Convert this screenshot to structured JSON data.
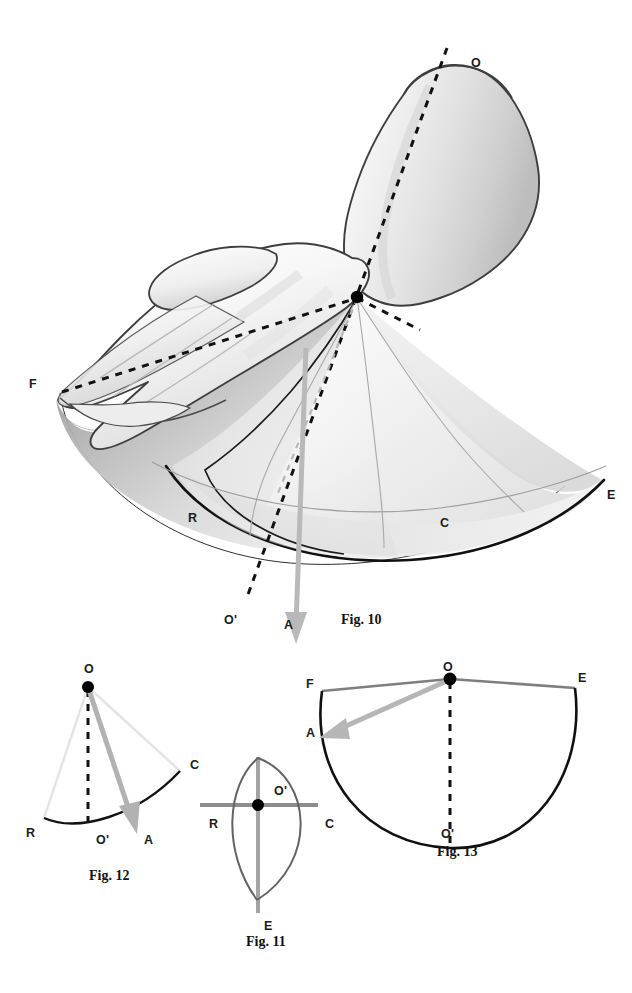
{
  "page": {
    "width": 632,
    "height": 993,
    "background": "#ffffff"
  },
  "colors": {
    "ink": "#1a1a1a",
    "outline": "#3c3c3c",
    "cone_edge_dark": "#111111",
    "cone_rule_gray": "#9a9a9a",
    "arrow_gray": "#b4b4b4",
    "radius_gray": "#8c8c8c",
    "lens_gray": "#6e6e6e",
    "axis_gray": "#9d9d9d",
    "faint_gray": "#e2e2e2",
    "skin_light": "#fbfbfb",
    "skin_mid": "#d8d8d8",
    "skin_shadow": "#9c9c9c"
  },
  "figures": [
    {
      "id": "fig10",
      "caption": "Fig. 10",
      "caption_pos": {
        "x": 341,
        "y": 613
      },
      "description": "Hand and forearm with cone of circumduction about the wrist",
      "labels": [
        {
          "text": "O",
          "name": "label-o",
          "x": 471,
          "y": 57,
          "meaning": "axis proximal point"
        },
        {
          "text": "F",
          "name": "label-f",
          "x": 29,
          "y": 378,
          "meaning": "flexion"
        },
        {
          "text": "E",
          "name": "label-e",
          "x": 607,
          "y": 489,
          "meaning": "extension"
        },
        {
          "text": "R",
          "name": "label-r",
          "x": 188,
          "y": 512,
          "meaning": "radial deviation"
        },
        {
          "text": "C",
          "name": "label-c",
          "x": 440,
          "y": 517,
          "meaning": "ulnar / cubital deviation"
        },
        {
          "text": "O'",
          "name": "label-o-prime",
          "x": 224,
          "y": 614,
          "meaning": "axis distal point"
        },
        {
          "text": "A",
          "name": "label-a",
          "x": 284,
          "y": 619,
          "meaning": "axis of the cone"
        }
      ]
    },
    {
      "id": "fig12",
      "caption": "Fig. 12",
      "caption_pos": {
        "x": 89,
        "y": 869
      },
      "description": "Lateral projection of the cone: sector O-R-C with axis OA",
      "labels": [
        {
          "text": "O",
          "name": "label-o",
          "x": 84,
          "y": 663,
          "meaning": "apex"
        },
        {
          "text": "C",
          "name": "label-c",
          "x": 190,
          "y": 759,
          "meaning": "ulnar / cubital deviation"
        },
        {
          "text": "R",
          "name": "label-r",
          "x": 26,
          "y": 827,
          "meaning": "radial deviation"
        },
        {
          "text": "O'",
          "name": "label-o-prime",
          "x": 96,
          "y": 834,
          "meaning": "axis foot"
        },
        {
          "text": "A",
          "name": "label-a",
          "x": 144,
          "y": 834,
          "meaning": "cone axis arrow"
        }
      ]
    },
    {
      "id": "fig11",
      "caption": "Fig. 11",
      "caption_pos": {
        "x": 246,
        "y": 935
      },
      "description": "Base of the cone seen end-on: an ellipse-like lens with axes R-C and O'-E",
      "labels": [
        {
          "text": "O'",
          "name": "label-o-prime",
          "x": 274,
          "y": 785,
          "meaning": "centre of base"
        },
        {
          "text": "R",
          "name": "label-r",
          "x": 209,
          "y": 818,
          "meaning": "radial deviation"
        },
        {
          "text": "C",
          "name": "label-c",
          "x": 325,
          "y": 818,
          "meaning": "ulnar / cubital deviation"
        },
        {
          "text": "E",
          "name": "label-e",
          "x": 264,
          "y": 920,
          "meaning": "extension"
        }
      ]
    },
    {
      "id": "fig13",
      "caption": "Fig. 13",
      "caption_pos": {
        "x": 437,
        "y": 845
      },
      "description": "Frontal projection of the cone: sector F-O-E with axis OO'",
      "labels": [
        {
          "text": "O",
          "name": "label-o",
          "x": 443,
          "y": 661,
          "meaning": "apex"
        },
        {
          "text": "F",
          "name": "label-f",
          "x": 306,
          "y": 678,
          "meaning": "flexion"
        },
        {
          "text": "E",
          "name": "label-e",
          "x": 578,
          "y": 672,
          "meaning": "extension"
        },
        {
          "text": "A",
          "name": "label-a",
          "x": 306,
          "y": 727,
          "meaning": "cone axis arrow"
        },
        {
          "text": "O'",
          "name": "label-o-prime",
          "x": 441,
          "y": 828,
          "meaning": "axis foot"
        }
      ]
    }
  ]
}
